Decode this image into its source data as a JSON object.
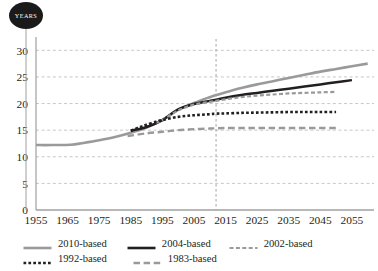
{
  "badge": {
    "label": "YEARS",
    "icon": "years-badge-circle",
    "color": "#1a1a1a"
  },
  "legend": {
    "rows": [
      [
        {
          "label": "2010-based",
          "style": "solid",
          "color": "#9a9a9a",
          "width": 2.6
        },
        {
          "label": "2004-based",
          "style": "solid",
          "color": "#231f20",
          "width": 2.6
        },
        {
          "label": "2002-based",
          "style": "dashed",
          "color": "#9a9a9a",
          "width": 2.2
        }
      ],
      [
        {
          "label": "1992-based",
          "style": "dotted",
          "color": "#231f20",
          "width": 2.6
        },
        {
          "label": "1983-based",
          "style": "longdash",
          "color": "#9a9a9a",
          "width": 2.4
        }
      ]
    ]
  },
  "chart_data": {
    "type": "line",
    "title": "",
    "subtitle": "",
    "xlabel": "",
    "ylabel": "YEARS",
    "xlim": [
      1955,
      2062
    ],
    "ylim": [
      0,
      31
    ],
    "yticks": [
      0,
      5,
      10,
      15,
      20,
      25,
      30
    ],
    "xticks": [
      1955,
      1965,
      1975,
      1985,
      1995,
      2005,
      2015,
      2025,
      2035,
      2045,
      2055
    ],
    "grid": "horizontal-dashed",
    "legend_position": "bottom",
    "annotations": [
      {
        "type": "vline",
        "x": 2012,
        "style": "dashed",
        "color": "#9a9a9a"
      }
    ],
    "series": [
      {
        "name": "2010-based",
        "color": "#9a9a9a",
        "style": "solid",
        "x": [
          1955,
          1960,
          1966,
          1970,
          1975,
          1980,
          1985,
          1990,
          1995,
          2000,
          2005,
          2010,
          2012,
          2015,
          2020,
          2025,
          2030,
          2035,
          2040,
          2045,
          2050,
          2055,
          2060
        ],
        "y": [
          12.2,
          12.2,
          12.25,
          12.6,
          13.1,
          13.7,
          14.5,
          15.5,
          16.9,
          18.8,
          20.1,
          21.2,
          21.6,
          22.1,
          22.9,
          23.6,
          24.2,
          24.8,
          25.4,
          26.0,
          26.5,
          27.0,
          27.5
        ]
      },
      {
        "name": "2004-based",
        "color": "#231f20",
        "style": "solid",
        "x": [
          1985,
          1990,
          1995,
          2000,
          2005,
          2010,
          2012,
          2015,
          2020,
          2025,
          2030,
          2035,
          2040,
          2045,
          2050,
          2055
        ],
        "y": [
          14.9,
          15.6,
          16.9,
          18.9,
          19.9,
          20.5,
          20.7,
          21.1,
          21.6,
          22.0,
          22.4,
          22.8,
          23.2,
          23.6,
          24.0,
          24.4
        ]
      },
      {
        "name": "2002-based",
        "color": "#9a9a9a",
        "style": "dashed",
        "x": [
          1993,
          1995,
          2000,
          2005,
          2010,
          2012,
          2015,
          2020,
          2025,
          2030,
          2035,
          2040,
          2045,
          2050
        ],
        "y": [
          16.4,
          16.9,
          18.7,
          19.8,
          20.3,
          20.5,
          20.8,
          21.2,
          21.5,
          21.7,
          21.9,
          22.0,
          22.1,
          22.2
        ]
      },
      {
        "name": "1992-based",
        "color": "#231f20",
        "style": "dotted",
        "x": [
          1985,
          1988,
          1990,
          1993,
          1995,
          2000,
          2005,
          2010,
          2012,
          2015,
          2020,
          2025,
          2030,
          2035,
          2040,
          2045,
          2050
        ],
        "y": [
          14.9,
          15.6,
          16.0,
          16.6,
          16.9,
          17.5,
          17.8,
          18.0,
          18.1,
          18.15,
          18.25,
          18.3,
          18.35,
          18.4,
          18.4,
          18.4,
          18.4
        ]
      },
      {
        "name": "1983-based",
        "color": "#9a9a9a",
        "style": "longdash",
        "x": [
          1984,
          1990,
          1995,
          2000,
          2005,
          2010,
          2012,
          2015,
          2020,
          2025,
          2030,
          2035,
          2040,
          2045,
          2050
        ],
        "y": [
          13.9,
          14.4,
          14.7,
          15.0,
          15.2,
          15.3,
          15.35,
          15.4,
          15.4,
          15.4,
          15.4,
          15.4,
          15.4,
          15.4,
          15.4
        ]
      }
    ]
  }
}
